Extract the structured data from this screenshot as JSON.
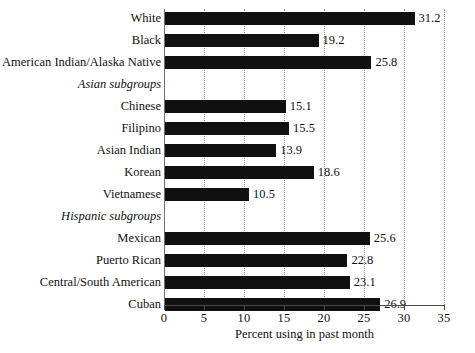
{
  "chart_data": {
    "type": "bar",
    "orientation": "horizontal",
    "title": "",
    "xlabel": "Percent using in past month",
    "ylabel": "",
    "xlim": [
      0,
      35
    ],
    "xticks": [
      "0",
      "5",
      "10",
      "15",
      "20",
      "25",
      "30",
      "35"
    ],
    "grid": "vertical-dotted",
    "legend": "none",
    "bar_color": "#111111",
    "background_color": "#ffffff",
    "categories": [
      "White",
      "Black",
      "American Indian/Alaska Native",
      "Asian subgroups",
      "Chinese",
      "Filipino",
      "Asian Indian",
      "Korean",
      "Vietnamese",
      "Hispanic subgroups",
      "Mexican",
      "Puerto Rican",
      "Central/South American",
      "Cuban"
    ],
    "values": [
      31.2,
      19.2,
      25.8,
      null,
      15.1,
      15.5,
      13.9,
      18.6,
      10.5,
      null,
      25.6,
      22.8,
      23.1,
      26.9
    ],
    "rows": [
      {
        "label": "White",
        "value": 31.2,
        "value_text": "31.2",
        "group_header": false
      },
      {
        "label": "Black",
        "value": 19.2,
        "value_text": "19.2",
        "group_header": false
      },
      {
        "label": "American Indian/Alaska Native",
        "value": 25.8,
        "value_text": "25.8",
        "group_header": false
      },
      {
        "label": "Asian subgroups",
        "value": null,
        "value_text": "",
        "group_header": true
      },
      {
        "label": "Chinese",
        "value": 15.1,
        "value_text": "15.1",
        "group_header": false
      },
      {
        "label": "Filipino",
        "value": 15.5,
        "value_text": "15.5",
        "group_header": false
      },
      {
        "label": "Asian Indian",
        "value": 13.9,
        "value_text": "13.9",
        "group_header": false
      },
      {
        "label": "Korean",
        "value": 18.6,
        "value_text": "18.6",
        "group_header": false
      },
      {
        "label": "Vietnamese",
        "value": 10.5,
        "value_text": "10.5",
        "group_header": false
      },
      {
        "label": "Hispanic subgroups",
        "value": null,
        "value_text": "",
        "group_header": true
      },
      {
        "label": "Mexican",
        "value": 25.6,
        "value_text": "25.6",
        "group_header": false
      },
      {
        "label": "Puerto Rican",
        "value": 22.8,
        "value_text": "22.8",
        "group_header": false
      },
      {
        "label": "Central/South American",
        "value": 23.1,
        "value_text": "23.1",
        "group_header": false
      },
      {
        "label": "Cuban",
        "value": 26.9,
        "value_text": "26.9",
        "group_header": false
      }
    ]
  }
}
